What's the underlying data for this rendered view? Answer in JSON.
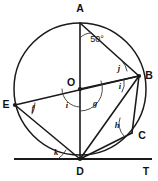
{
  "figure": {
    "kind": "circle-geometry-diagram",
    "background_color": "#ffffff",
    "stroke_color": "#1a1a1a",
    "width": 158,
    "height": 181
  },
  "circle": {
    "center_label": "O",
    "cx": 80,
    "cy": 89,
    "r": 66
  },
  "points": [
    {
      "id": "A",
      "label": "A",
      "x": 80,
      "y": 23,
      "label_x": 80,
      "label_y": 9,
      "dot": false
    },
    {
      "id": "B",
      "label": "B",
      "x": 139,
      "y": 76,
      "label_x": 149,
      "label_y": 76,
      "dot": true
    },
    {
      "id": "C",
      "label": "C",
      "x": 132,
      "y": 133,
      "label_x": 142,
      "label_y": 136,
      "dot": false
    },
    {
      "id": "D",
      "label": "D",
      "x": 80,
      "y": 159,
      "label_x": 80,
      "label_y": 172,
      "dot": true
    },
    {
      "id": "E",
      "label": "E",
      "x": 15,
      "y": 105,
      "label_x": 6,
      "label_y": 105,
      "dot": true
    },
    {
      "id": "O",
      "label": "O",
      "x": 80,
      "y": 89,
      "label_x": 71,
      "label_y": 83,
      "dot": true
    },
    {
      "id": "T",
      "label": "T",
      "x": 146,
      "y": 159,
      "label_x": 146,
      "label_y": 172,
      "dot": false
    }
  ],
  "tangent": {
    "name": "tangent-at-D",
    "x1": 14,
    "y1": 159,
    "x2": 152,
    "y2": 159
  },
  "segments": [
    {
      "name": "chord-A-D-diameter",
      "from": "A",
      "to": "D"
    },
    {
      "name": "chord-E-B-diameter",
      "from": "E",
      "to": "B"
    },
    {
      "name": "chord-A-B",
      "from": "A",
      "to": "B"
    },
    {
      "name": "chord-B-D",
      "from": "B",
      "to": "D"
    },
    {
      "name": "chord-B-C",
      "from": "B",
      "to": "C"
    },
    {
      "name": "chord-C-D",
      "from": "C",
      "to": "D"
    },
    {
      "name": "chord-E-D",
      "from": "E",
      "to": "D"
    },
    {
      "name": "chord-O-B",
      "from": "O",
      "to": "B"
    }
  ],
  "angle_marks": [
    {
      "id": "angle-A-50",
      "label": "50°",
      "vertex": "A",
      "label_x": 97,
      "label_y": 40,
      "arc": "M 80 38 A 15 15 0 0 1 91 33"
    },
    {
      "id": "angle-B-j",
      "label": "j",
      "vertex": "B",
      "label_x": 119,
      "label_y": 69,
      "arc": "M 122 61 A 19 19 0 0 1 127 71"
    },
    {
      "id": "angle-B-i",
      "label": "i",
      "vertex": "B",
      "label_x": 120,
      "label_y": 87,
      "arc": "M 124 80 A 17 17 0 0 1 122 92"
    },
    {
      "id": "angle-O-i",
      "label": "i",
      "vertex": "O",
      "label_x": 67,
      "label_y": 106,
      "arc": "M 62 89 A 18 18 0 0 0 80 107"
    },
    {
      "id": "angle-O-g",
      "label": "g",
      "vertex": "O",
      "label_x": 95,
      "label_y": 104,
      "arc": "M 80 111 A 22 22 0 0 0 101 81"
    },
    {
      "id": "angle-E-f",
      "label": "f",
      "vertex": "E",
      "label_x": 33,
      "label_y": 109,
      "arc": "M 35 103 A 21 21 0 0 1 32 114"
    },
    {
      "id": "angle-C-h",
      "label": "h",
      "vertex": "C",
      "label_x": 117,
      "label_y": 126,
      "arc": "M 120 118 A 17 17 0 0 0 124 136"
    },
    {
      "id": "angle-D-k",
      "label": "k",
      "vertex": "D",
      "label_x": 56,
      "label_y": 153,
      "arc": "M 59 158 A 21 21 0 0 0 66 150"
    }
  ]
}
